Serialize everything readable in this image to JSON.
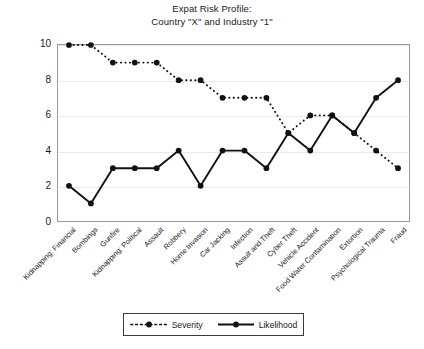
{
  "title": {
    "line1": "Expat Risk Profile:",
    "line2": "Country \"X\" and Industry \"1\""
  },
  "legend": {
    "severity_label": "Severity",
    "likelihood_label": "Likelihood"
  },
  "axis": {
    "yticks": [
      "0",
      "2",
      "4",
      "6",
      "8",
      "10"
    ]
  },
  "colors": {
    "series": "#111111",
    "frame": "#9a9a9a",
    "grid": "#e9e9e9",
    "background": "#ffffff"
  },
  "chart_data": {
    "type": "line",
    "title": "Expat Risk Profile: Country \"X\" and Industry \"1\"",
    "xlabel": "",
    "ylabel": "",
    "ylim": [
      0,
      10
    ],
    "ytick_step": 2,
    "grid": true,
    "legend_position": "bottom-center",
    "categories": [
      "Kidnapping: Financial",
      "Bombings",
      "Gunfire",
      "Kidnapping: Political",
      "Assault",
      "Robbery",
      "Home Invasion",
      "Car Jacking",
      "Infection",
      "Assult and Theft",
      "Cyber Theft",
      "Vehicle Accident",
      "Food Water Contamination",
      "Extortion",
      "Psychological Trauma",
      "Fraud"
    ],
    "series": [
      {
        "name": "Severity",
        "style": "dotted",
        "marker": "circle",
        "values": [
          10,
          10,
          9,
          9,
          9,
          8,
          8,
          7,
          7,
          7,
          5,
          6,
          6,
          5,
          4,
          3
        ]
      },
      {
        "name": "Likelihood",
        "style": "solid",
        "marker": "circle",
        "values": [
          2,
          1,
          3,
          3,
          3,
          4,
          2,
          4,
          4,
          3,
          5,
          4,
          6,
          5,
          7,
          8
        ]
      }
    ]
  }
}
